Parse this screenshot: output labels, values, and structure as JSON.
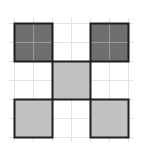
{
  "diagram": {
    "type": "grid-pattern",
    "grid": {
      "cols": 6,
      "rows": 6,
      "cell_size": 19,
      "origin_x": 14,
      "origin_y": 23,
      "line_color": "#e2e2e2",
      "overhang": 5
    },
    "squares": [
      {
        "col": 0,
        "row": 0,
        "size": 2,
        "shade": "dark",
        "fill": "#6f6f6f",
        "inner_grid": true
      },
      {
        "col": 4,
        "row": 0,
        "size": 2,
        "shade": "dark",
        "fill": "#6f6f6f",
        "inner_grid": true
      },
      {
        "col": 2,
        "row": 2,
        "size": 2,
        "shade": "light",
        "fill": "#c2c2c2",
        "inner_grid": false
      },
      {
        "col": 0,
        "row": 4,
        "size": 2,
        "shade": "light",
        "fill": "#c2c2c2",
        "inner_grid": false
      },
      {
        "col": 4,
        "row": 4,
        "size": 2,
        "shade": "light",
        "fill": "#c2c2c2",
        "inner_grid": false
      }
    ],
    "border_color": "#1f1f1f",
    "inner_line_color": "#9a9a9a"
  }
}
